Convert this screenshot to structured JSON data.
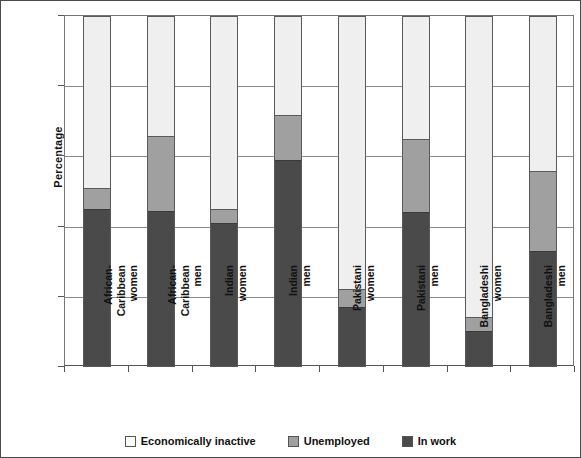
{
  "chart_data": {
    "type": "bar",
    "subtype": "stacked-100-percent",
    "title": "",
    "xlabel": "",
    "ylabel": "Percentage",
    "ylim": [
      0,
      100
    ],
    "yticks": [
      0,
      20,
      40,
      60,
      80,
      100
    ],
    "ytick_labels": [
      "0",
      "20",
      "40",
      "60",
      "80",
      "100"
    ],
    "grid": true,
    "legend_position": "bottom",
    "categories": [
      "African-\nCaribbean\nwomen",
      "African-\nCaribbean\nmen",
      "Indian\nwomen",
      "Indian\nmen",
      "Pakistani\nwomen",
      "Pakistani\nmen",
      "Bangladeshi\nwomen",
      "Bangladeshi\nmen"
    ],
    "series": [
      {
        "name": "Economically inactive",
        "color": "#efefef",
        "values": [
          49,
          34,
          55,
          28,
          78,
          35,
          86,
          44
        ]
      },
      {
        "name": "Unemployed",
        "color": "#a0a0a0",
        "values": [
          6,
          21.5,
          4,
          13,
          5,
          21,
          4,
          23
        ]
      },
      {
        "name": "In work",
        "color": "#4a4a4a",
        "values": [
          45,
          44.5,
          41,
          59,
          17,
          44,
          10,
          33
        ]
      }
    ],
    "legend": [
      {
        "label": "Economically inactive",
        "swatch": "inactive"
      },
      {
        "label": "Unemployed",
        "swatch": "unemployed"
      },
      {
        "label": "In work",
        "swatch": "inwork"
      }
    ]
  }
}
